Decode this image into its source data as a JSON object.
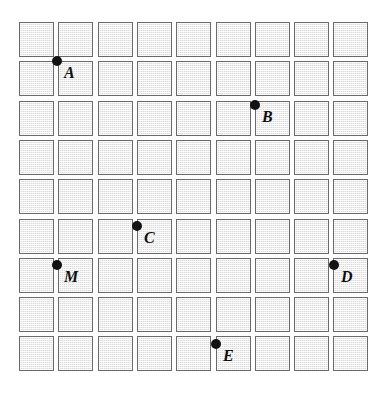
{
  "figure": {
    "type": "diagram",
    "canvas": {
      "width": 390,
      "height": 406,
      "background": "#ffffff"
    },
    "grid": {
      "columns": 9,
      "rows": 9,
      "cell_size": 35,
      "cell_pitch": 39.3,
      "origin_x": 19,
      "origin_y": 22,
      "cell_fill": "#dcdcdc",
      "cell_border": "#6a6a6a",
      "cell_pattern": "fine-dotted-hatch"
    },
    "points": [
      {
        "label": "A",
        "col": 1,
        "row": 1,
        "x": 57,
        "y": 61,
        "label_x": 64,
        "label_y": 65
      },
      {
        "label": "B",
        "col": 6,
        "row": 2,
        "x": 255,
        "y": 105,
        "label_x": 262,
        "label_y": 109
      },
      {
        "label": "C",
        "col": 3,
        "row": 5,
        "x": 137,
        "y": 226,
        "label_x": 144,
        "label_y": 230
      },
      {
        "label": "M",
        "col": 1,
        "row": 6,
        "x": 57,
        "y": 265,
        "label_x": 64,
        "label_y": 269
      },
      {
        "label": "D",
        "col": 8,
        "row": 6,
        "x": 334,
        "y": 265,
        "label_x": 341,
        "label_y": 269
      },
      {
        "label": "E",
        "col": 5,
        "row": 8,
        "x": 216,
        "y": 344,
        "label_x": 223,
        "label_y": 348
      }
    ],
    "point_style": {
      "color": "#121212",
      "radius": 5,
      "shape": "filled-circle"
    },
    "label_style": {
      "color": "#101010",
      "font_style": "italic-serif-bold",
      "font_size": 16
    }
  }
}
